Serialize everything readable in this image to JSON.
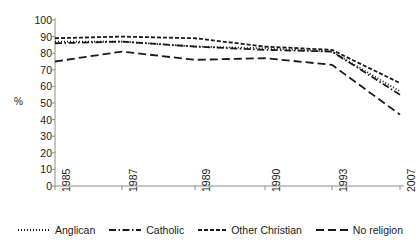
{
  "chart_data": {
    "type": "line",
    "title": "",
    "xlabel": "",
    "ylabel": "%",
    "ylim": [
      0,
      100
    ],
    "ytick_step": 10,
    "grid": false,
    "legend_position": "bottom",
    "x_is_categorical": true,
    "categories": [
      "1985",
      "1987",
      "1989",
      "1990",
      "1993",
      "2007"
    ],
    "yticks": [
      "100",
      "90",
      "80",
      "70",
      "60",
      "50",
      "40",
      "30",
      "20",
      "10",
      "0"
    ],
    "series": [
      {
        "name": "Anglican",
        "dash": "dotted",
        "color": "#1a1a1a",
        "values": [
          87,
          87,
          84,
          83,
          81,
          57
        ]
      },
      {
        "name": "Catholic",
        "dash": "dash-dot",
        "color": "#1a1a1a",
        "values": [
          86,
          87,
          84,
          82,
          81,
          55
        ]
      },
      {
        "name": "Other Christian",
        "dash": "short-dash",
        "color": "#1a1a1a",
        "values": [
          89,
          90,
          89,
          84,
          82,
          62
        ]
      },
      {
        "name": "No religion",
        "dash": "long-dash",
        "color": "#1a1a1a",
        "values": [
          75,
          81,
          76,
          77,
          73,
          43
        ]
      }
    ]
  },
  "axis": {
    "y_title": "%"
  },
  "legend": {
    "items": [
      {
        "label": "Anglican"
      },
      {
        "label": "Catholic"
      },
      {
        "label": "Other Christian"
      },
      {
        "label": "No religion"
      }
    ]
  }
}
